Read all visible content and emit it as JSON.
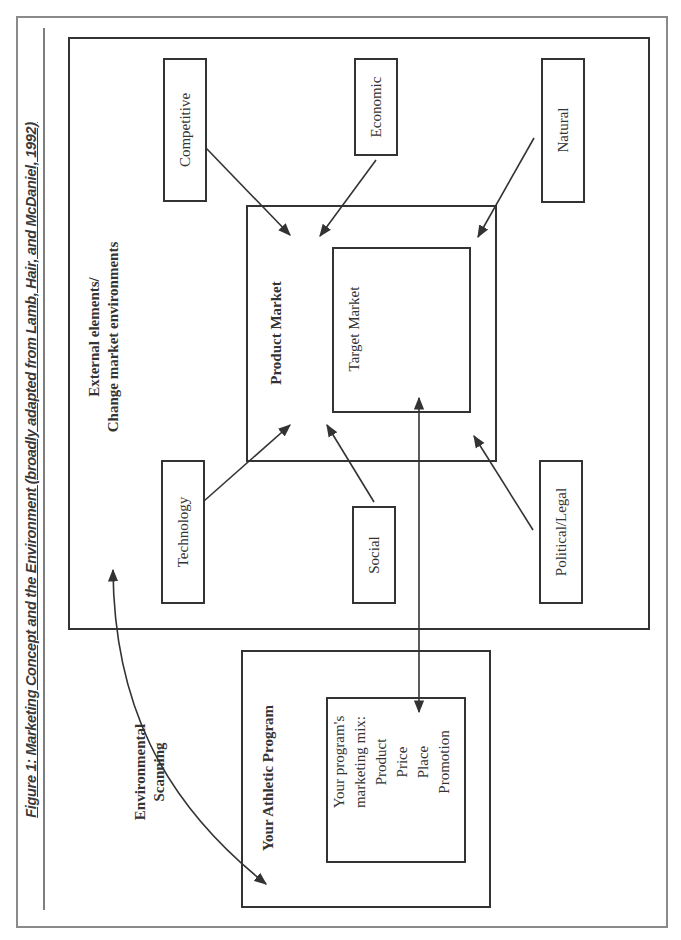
{
  "figure": {
    "title": "Figure 1: Marketing Concept and the Environment (broadly adapted from Lamb, Hair, and McDaniel, 1992)"
  },
  "environment": {
    "heading_line1": "External elements/",
    "heading_line2": "Change market environments",
    "factors": [
      {
        "id": "competitive",
        "label": "Competitive"
      },
      {
        "id": "economic",
        "label": "Economic"
      },
      {
        "id": "natural",
        "label": "Natural"
      },
      {
        "id": "technology",
        "label": "Technology"
      },
      {
        "id": "social",
        "label": "Social"
      },
      {
        "id": "political-legal",
        "label": "Political/Legal"
      }
    ]
  },
  "product_market": {
    "label": "Product Market",
    "target_market": {
      "label": "Target Market"
    }
  },
  "scanning": {
    "line1": "Environmental",
    "line2": "Scanning"
  },
  "athletic_program": {
    "label": "Your Athletic Program",
    "mix": {
      "lines": [
        "Your program's",
        "marketing mix:",
        "Product",
        "Price",
        "Place",
        "Promotion"
      ]
    }
  },
  "colors": {
    "line": "#333333",
    "frame": "#8a8a8a",
    "text": "#333333"
  }
}
